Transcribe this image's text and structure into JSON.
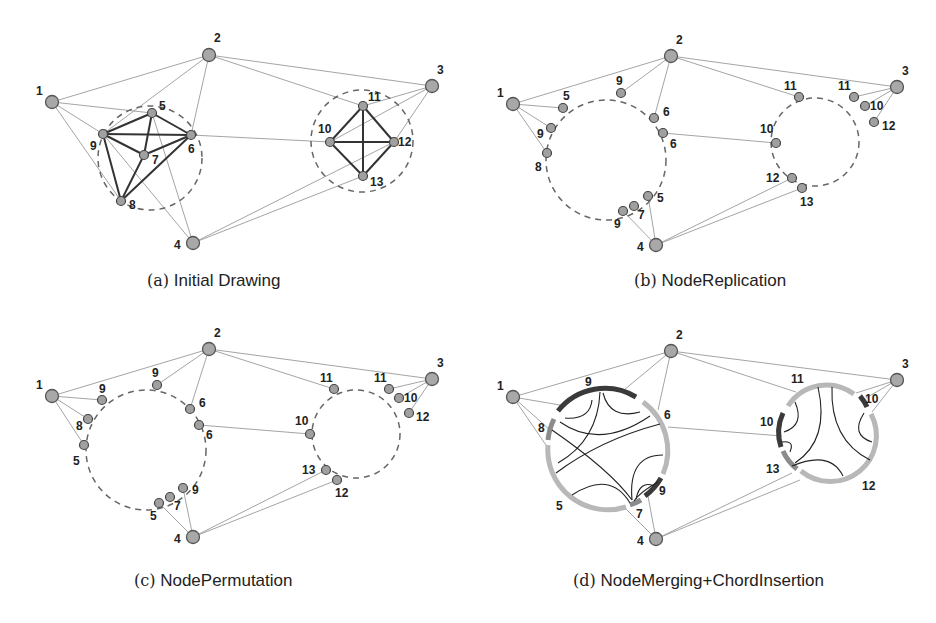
{
  "figure": {
    "panels": [
      {
        "id": "a",
        "caption_tag": "(a)",
        "caption_text": "Initial Drawing",
        "outer_nodes": [
          {
            "id": "1",
            "x": 52,
            "y": 102,
            "lx": 36,
            "ly": 95
          },
          {
            "id": "2",
            "x": 209,
            "y": 55,
            "lx": 214,
            "ly": 42
          },
          {
            "id": "3",
            "x": 432,
            "y": 86,
            "lx": 437,
            "ly": 74
          },
          {
            "id": "4",
            "x": 193,
            "y": 243,
            "lx": 174,
            "ly": 249
          }
        ],
        "clusters": [
          {
            "cx": 150,
            "cy": 158,
            "r": 52
          },
          {
            "cx": 362,
            "cy": 141,
            "r": 51
          }
        ],
        "inner_nodes": [
          {
            "id": "5",
            "x": 152,
            "y": 113,
            "lx": 159,
            "ly": 110
          },
          {
            "id": "9",
            "x": 103,
            "y": 134,
            "lx": 90,
            "ly": 150
          },
          {
            "id": "6",
            "x": 191,
            "y": 135,
            "lx": 188,
            "ly": 153
          },
          {
            "id": "7",
            "x": 144,
            "y": 155,
            "lx": 152,
            "ly": 164
          },
          {
            "id": "8",
            "x": 121,
            "y": 201,
            "lx": 129,
            "ly": 209
          },
          {
            "id": "11",
            "x": 363,
            "y": 106,
            "lx": 368,
            "ly": 101
          },
          {
            "id": "10",
            "x": 330,
            "y": 142,
            "lx": 318,
            "ly": 133
          },
          {
            "id": "12",
            "x": 394,
            "y": 142,
            "lx": 398,
            "ly": 146
          },
          {
            "id": "13",
            "x": 363,
            "y": 176,
            "lx": 370,
            "ly": 186
          }
        ]
      },
      {
        "id": "b",
        "caption_tag": "(b)",
        "caption_text": "NodeReplication",
        "outer_nodes": [
          {
            "id": "1",
            "x": 513,
            "y": 104,
            "lx": 497,
            "ly": 97
          },
          {
            "id": "2",
            "x": 671,
            "y": 56,
            "lx": 676,
            "ly": 44
          },
          {
            "id": "3",
            "x": 897,
            "y": 87,
            "lx": 902,
            "ly": 75
          },
          {
            "id": "4",
            "x": 656,
            "y": 245,
            "lx": 637,
            "ly": 251
          }
        ],
        "clusters": [
          {
            "cx": 606,
            "cy": 160,
            "r": 60
          },
          {
            "cx": 815,
            "cy": 142,
            "r": 44
          }
        ],
        "inner_nodes": [
          {
            "id": "5",
            "x": 563,
            "y": 108,
            "lx": 563,
            "ly": 100
          },
          {
            "id": "9",
            "x": 551,
            "y": 128,
            "lx": 537,
            "ly": 138
          },
          {
            "id": "8",
            "x": 547,
            "y": 153,
            "lx": 535,
            "ly": 171
          },
          {
            "id": "9",
            "x": 621,
            "y": 93,
            "lx": 616,
            "ly": 85
          },
          {
            "id": "6",
            "x": 654,
            "y": 118,
            "lx": 663,
            "ly": 116
          },
          {
            "id": "6",
            "x": 663,
            "y": 133,
            "lx": 670,
            "ly": 148
          },
          {
            "id": "5",
            "x": 648,
            "y": 196,
            "lx": 657,
            "ly": 202
          },
          {
            "id": "7",
            "x": 634,
            "y": 206,
            "lx": 638,
            "ly": 219
          },
          {
            "id": "9",
            "x": 623,
            "y": 211,
            "lx": 614,
            "ly": 228
          },
          {
            "id": "11",
            "x": 799,
            "y": 97,
            "lx": 784,
            "ly": 90
          },
          {
            "id": "11",
            "x": 854,
            "y": 97,
            "lx": 838,
            "ly": 90
          },
          {
            "id": "10",
            "x": 865,
            "y": 106,
            "lx": 870,
            "ly": 110
          },
          {
            "id": "12",
            "x": 874,
            "y": 122,
            "lx": 882,
            "ly": 130
          },
          {
            "id": "10",
            "x": 776,
            "y": 143,
            "lx": 760,
            "ly": 133
          },
          {
            "id": "12",
            "x": 792,
            "y": 178,
            "lx": 766,
            "ly": 182
          },
          {
            "id": "13",
            "x": 802,
            "y": 188,
            "lx": 800,
            "ly": 206
          }
        ]
      },
      {
        "id": "c",
        "caption_tag": "(c)",
        "caption_text": "NodePermutation",
        "outer_nodes": [
          {
            "id": "1",
            "x": 52,
            "y": 396,
            "lx": 36,
            "ly": 389
          },
          {
            "id": "2",
            "x": 209,
            "y": 349,
            "lx": 214,
            "ly": 337
          },
          {
            "id": "3",
            "x": 432,
            "y": 379,
            "lx": 437,
            "ly": 367
          },
          {
            "id": "4",
            "x": 193,
            "y": 537,
            "lx": 174,
            "ly": 543
          }
        ],
        "clusters": [
          {
            "cx": 146,
            "cy": 450,
            "r": 60
          },
          {
            "cx": 356,
            "cy": 434,
            "r": 44
          }
        ],
        "inner_nodes": [
          {
            "id": "9",
            "x": 102,
            "y": 400,
            "lx": 99,
            "ly": 393
          },
          {
            "id": "8",
            "x": 88,
            "y": 419,
            "lx": 76,
            "ly": 430
          },
          {
            "id": "5",
            "x": 84,
            "y": 445,
            "lx": 73,
            "ly": 465
          },
          {
            "id": "9",
            "x": 157,
            "y": 385,
            "lx": 152,
            "ly": 377
          },
          {
            "id": "6",
            "x": 190,
            "y": 409,
            "lx": 199,
            "ly": 407
          },
          {
            "id": "6",
            "x": 199,
            "y": 425,
            "lx": 206,
            "ly": 439
          },
          {
            "id": "9",
            "x": 183,
            "y": 488,
            "lx": 192,
            "ly": 494
          },
          {
            "id": "7",
            "x": 170,
            "y": 497,
            "lx": 174,
            "ly": 510
          },
          {
            "id": "5",
            "x": 159,
            "y": 503,
            "lx": 150,
            "ly": 520
          },
          {
            "id": "11",
            "x": 334,
            "y": 389,
            "lx": 320,
            "ly": 382
          },
          {
            "id": "11",
            "x": 389,
            "y": 389,
            "lx": 374,
            "ly": 382
          },
          {
            "id": "10",
            "x": 399,
            "y": 398,
            "lx": 404,
            "ly": 402
          },
          {
            "id": "12",
            "x": 409,
            "y": 413,
            "lx": 416,
            "ly": 421
          },
          {
            "id": "10",
            "x": 310,
            "y": 434,
            "lx": 295,
            "ly": 425
          },
          {
            "id": "13",
            "x": 326,
            "y": 470,
            "lx": 302,
            "ly": 474
          },
          {
            "id": "12",
            "x": 337,
            "y": 480,
            "lx": 335,
            "ly": 497
          }
        ]
      },
      {
        "id": "d",
        "caption_tag": "(d)",
        "caption_text": "NodeMerging+ChordInsertion",
        "outer_nodes": [
          {
            "id": "1",
            "x": 513,
            "y": 397,
            "lx": 497,
            "ly": 390
          },
          {
            "id": "2",
            "x": 671,
            "y": 351,
            "lx": 676,
            "ly": 339
          },
          {
            "id": "3",
            "x": 897,
            "y": 380,
            "lx": 902,
            "ly": 368
          },
          {
            "id": "4",
            "x": 656,
            "y": 539,
            "lx": 637,
            "ly": 545
          }
        ],
        "circles": [
          {
            "cx": 608,
            "cy": 450,
            "r": 60
          },
          {
            "cx": 828,
            "cy": 432,
            "r": 46
          }
        ],
        "arc_labels": [
          {
            "id": "9",
            "lx": 585,
            "ly": 386
          },
          {
            "id": "6",
            "lx": 664,
            "ly": 419
          },
          {
            "id": "8",
            "lx": 538,
            "ly": 432
          },
          {
            "id": "9",
            "lx": 659,
            "ly": 495
          },
          {
            "id": "7",
            "lx": 636,
            "ly": 518
          },
          {
            "id": "5",
            "lx": 556,
            "ly": 510
          },
          {
            "id": "11",
            "lx": 791,
            "ly": 383
          },
          {
            "id": "10",
            "lx": 865,
            "ly": 403
          },
          {
            "id": "10",
            "lx": 760,
            "ly": 426
          },
          {
            "id": "13",
            "lx": 766,
            "ly": 473
          },
          {
            "id": "12",
            "lx": 862,
            "ly": 490
          }
        ]
      }
    ],
    "colors": {
      "background": "#ffffff",
      "node_fill": "#a8a8a8",
      "thin_edge": "#9a9a9a",
      "bold_edge": "#333333",
      "dashed_circle": "#666666",
      "arc_dark": "#3a3a3a",
      "arc_mid": "#8c8c8c",
      "arc_light": "#b8b8b8"
    }
  }
}
